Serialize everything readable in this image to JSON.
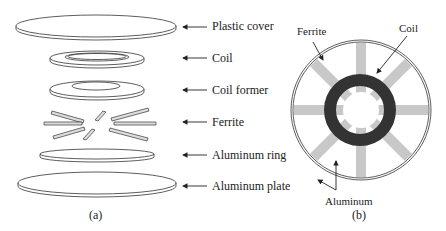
{
  "panel_a": {
    "caption": "(a)",
    "layers": [
      {
        "label": "Plastic cover"
      },
      {
        "label": "Coil"
      },
      {
        "label": "Coil former"
      },
      {
        "label": "Ferrite"
      },
      {
        "label": "Aluminum ring"
      },
      {
        "label": "Aluminum plate"
      }
    ]
  },
  "panel_b": {
    "caption": "(b)",
    "labels": {
      "ferrite": "Ferrite",
      "coil": "Coil",
      "aluminum": "Aluminum"
    }
  },
  "colors": {
    "line": "#333333",
    "ferrite": "#c8c8c8",
    "coil": "#333333"
  }
}
